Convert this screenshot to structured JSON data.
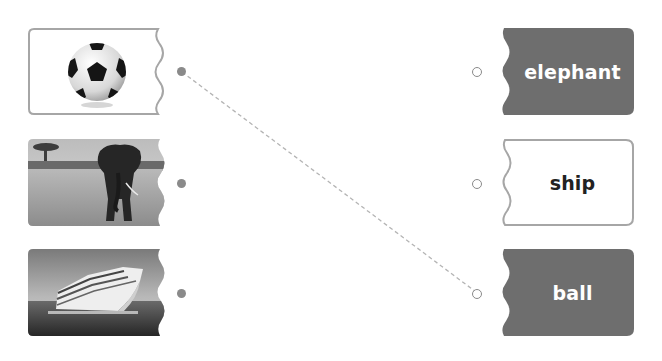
{
  "colors": {
    "card_dark": "#6e6e6e",
    "card_border": "#a6a6a6",
    "word_on_dark": "#ffffff",
    "word_on_light": "#222222",
    "dot": "#8a8a8a",
    "connector": "#b0b0b0"
  },
  "left_items": [
    {
      "id": "picture-ball",
      "icon": "soccer-ball-image",
      "style": "outlined"
    },
    {
      "id": "picture-elephant",
      "icon": "elephant-image",
      "style": "photo"
    },
    {
      "id": "picture-ship",
      "icon": "cruise-ship-image",
      "style": "photo"
    }
  ],
  "right_items": [
    {
      "label": "elephant",
      "style": "dark"
    },
    {
      "label": "ship",
      "style": "light"
    },
    {
      "label": "ball",
      "style": "dark"
    }
  ],
  "connections": [
    {
      "from": 0,
      "to": 2,
      "line": "dashed"
    }
  ]
}
